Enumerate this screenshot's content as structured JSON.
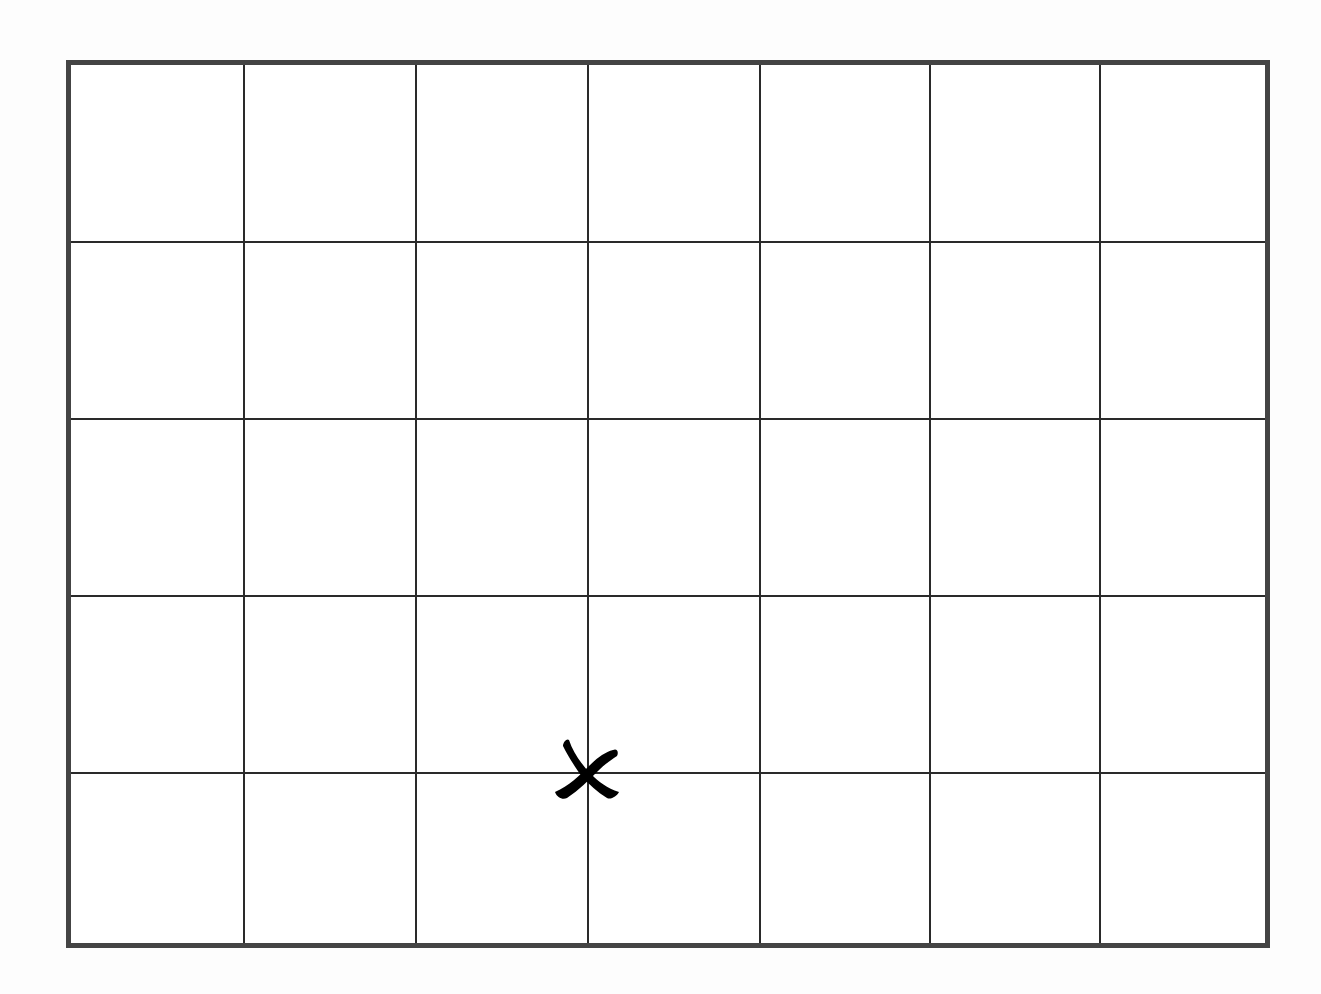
{
  "board": {
    "rows": 5,
    "cols": 7,
    "frame_color": "#444444",
    "line_color": "#2a2a2a",
    "col_boundaries_px": [
      0,
      172,
      344,
      516,
      688,
      858,
      1028,
      1199
    ],
    "row_boundaries_px": [
      0,
      176,
      353,
      530,
      707,
      883
    ]
  },
  "marks": [
    {
      "type": "x",
      "icon": "x-mark-icon",
      "color": "#000000",
      "intersection": {
        "col_line": 3,
        "row_line": 4
      }
    }
  ]
}
